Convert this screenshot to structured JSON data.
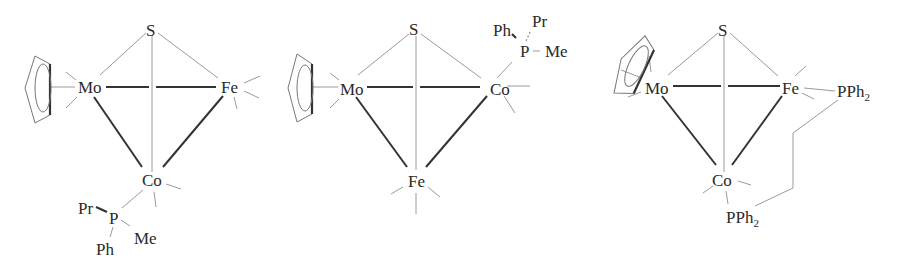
{
  "figure": {
    "structures": [
      {
        "id": "cluster-1",
        "atoms": {
          "apex": "S",
          "left": "Mo",
          "right": "Fe",
          "bottom": "Co"
        },
        "ring": "cyclopentadienyl",
        "phosphine": {
          "atom": "P",
          "substituents": [
            "Pr",
            "Me",
            "Ph"
          ],
          "bound_to": "Co"
        }
      },
      {
        "id": "cluster-2",
        "atoms": {
          "apex": "S",
          "left": "Mo",
          "right": "Co",
          "bottom": "Fe"
        },
        "ring": "cyclopentadienyl",
        "phosphine": {
          "atom": "P",
          "substituents": [
            "Ph",
            "Pr",
            "Me"
          ],
          "bound_to": "Co"
        }
      },
      {
        "id": "cluster-3",
        "atoms": {
          "apex": "S",
          "left": "Mo",
          "right": "Fe",
          "bottom": "Co"
        },
        "ring": "cyclopentadienyl",
        "bridging_ligand": {
          "group_right": "PPh",
          "group_right_sub": "2",
          "group_bottom": "PPh",
          "group_bottom_sub": "2"
        }
      }
    ]
  }
}
